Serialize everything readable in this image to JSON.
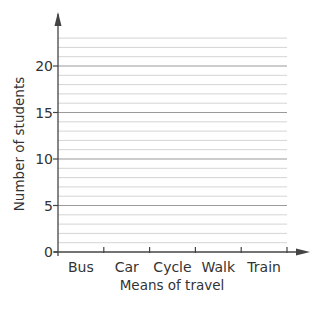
{
  "chart_data": {
    "type": "bar",
    "title": "",
    "xlabel": "Means of travel",
    "ylabel": "Number of students",
    "categories": [
      "Bus",
      "Car",
      "Cycle",
      "Walk",
      "Train"
    ],
    "values": [
      null,
      null,
      null,
      null,
      null
    ],
    "ylim": [
      0,
      23
    ],
    "yticks": [
      0,
      5,
      10,
      15,
      20
    ],
    "ytick_labels": [
      "0",
      "5",
      "10",
      "15",
      "20"
    ],
    "minor_grid_step": 1,
    "major_grid_step": 5,
    "grid": true,
    "legend": null,
    "note": "Blank bar chart grid with no bars drawn"
  },
  "colors": {
    "axis": "#444444",
    "major_grid": "#9a9a9a",
    "minor_grid": "#d4d4d4",
    "text": "#333333"
  }
}
